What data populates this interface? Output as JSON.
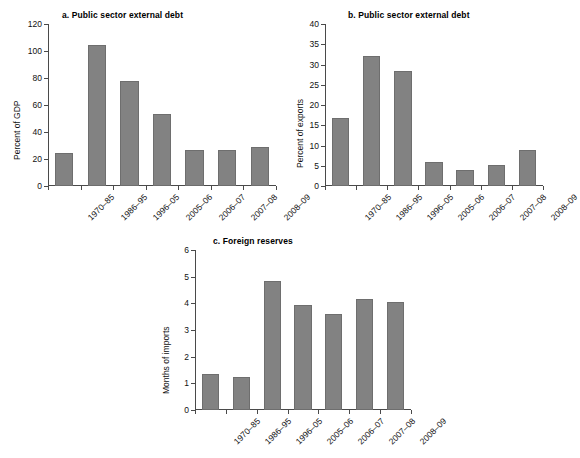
{
  "chart_data": [
    {
      "id": "a",
      "type": "bar",
      "title": "a. Public sector external debt",
      "xlabel": "",
      "ylabel": "Percent of GDP",
      "ylim": [
        0,
        120
      ],
      "ytick_step": 20,
      "yticks": [
        0,
        20,
        40,
        60,
        80,
        100,
        120
      ],
      "ytick_labels": [
        "0",
        "20",
        "40",
        "60",
        "80",
        "100",
        "120"
      ],
      "grid": false,
      "legend": false,
      "bar_color": "#828282",
      "categories": [
        "1970–85",
        "1986–95",
        "1996–05",
        "2005–06",
        "2006–07",
        "2007–08",
        "2008–09"
      ],
      "values": [
        24.5,
        104.5,
        77.5,
        53.0,
        27.0,
        27.0,
        29.0
      ]
    },
    {
      "id": "b",
      "type": "bar",
      "title": "b. Public sector external debt",
      "xlabel": "",
      "ylabel": "Percent of exports",
      "ylim": [
        0,
        40
      ],
      "ytick_step": 5,
      "yticks": [
        0,
        5,
        10,
        15,
        20,
        25,
        30,
        35,
        40
      ],
      "ytick_labels": [
        "0",
        "5",
        "10",
        "15",
        "20",
        "25",
        "30",
        "35",
        "40"
      ],
      "grid": false,
      "legend": false,
      "bar_color": "#828282",
      "categories": [
        "1970–85",
        "1986–95",
        "1996–05",
        "2005–06",
        "2006–07",
        "2007–08",
        "2008–09"
      ],
      "values": [
        16.8,
        32.2,
        28.4,
        6.0,
        4.0,
        5.3,
        8.8
      ]
    },
    {
      "id": "c",
      "type": "bar",
      "title": "c. Foreign reserves",
      "xlabel": "",
      "ylabel": "Months of imports",
      "ylim": [
        0,
        6
      ],
      "ytick_step": 1,
      "yticks": [
        0,
        1,
        2,
        3,
        4,
        5,
        6
      ],
      "ytick_labels": [
        "0",
        "1",
        "2",
        "3",
        "4",
        "5",
        "6"
      ],
      "grid": false,
      "legend": false,
      "bar_color": "#828282",
      "categories": [
        "1970–85",
        "1986–95",
        "1996–05",
        "2005–06",
        "2006–07",
        "2007–08",
        "2008–09"
      ],
      "values": [
        1.35,
        1.22,
        4.82,
        3.93,
        3.6,
        4.18,
        4.06
      ]
    }
  ]
}
